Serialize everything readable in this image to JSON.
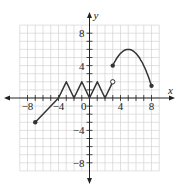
{
  "chart_data": {
    "type": "line",
    "title": "",
    "xlabel": "x",
    "ylabel": "y",
    "xlim": [
      -9,
      9
    ],
    "ylim": [
      -9,
      9
    ],
    "grid": true,
    "x_ticks": [
      -8,
      -4,
      0,
      4,
      8
    ],
    "y_ticks": [
      8,
      4,
      -4,
      -8
    ],
    "x_tick_labels": [
      "-8",
      "-4",
      "0",
      "4",
      "8"
    ],
    "y_tick_labels": [
      "8",
      "4",
      "-4",
      "-8"
    ],
    "origin_label": "0",
    "series": [
      {
        "name": "segment-1-line",
        "points": [
          [
            -7,
            -3
          ],
          [
            -4,
            0
          ]
        ],
        "start_marker": "closed",
        "end_marker": "none"
      },
      {
        "name": "segment-2-zigzag",
        "points": [
          [
            -4,
            0
          ],
          [
            -3,
            2
          ],
          [
            -2,
            0
          ],
          [
            -1,
            2
          ],
          [
            0,
            0
          ],
          [
            1,
            2
          ],
          [
            2,
            0
          ],
          [
            3,
            2
          ]
        ],
        "start_marker": "none",
        "end_marker": "open"
      },
      {
        "name": "segment-3-parabola",
        "points": [
          [
            3,
            4
          ],
          [
            4,
            5.6
          ],
          [
            5,
            6
          ],
          [
            6,
            5.6
          ],
          [
            7,
            4
          ],
          [
            8,
            1.5
          ]
        ],
        "start_marker": "closed",
        "end_marker": "closed",
        "vertex": [
          5,
          6
        ]
      }
    ],
    "colors": {
      "curve": "#333333",
      "grid": "#cccccc",
      "axis": "#222222"
    }
  }
}
